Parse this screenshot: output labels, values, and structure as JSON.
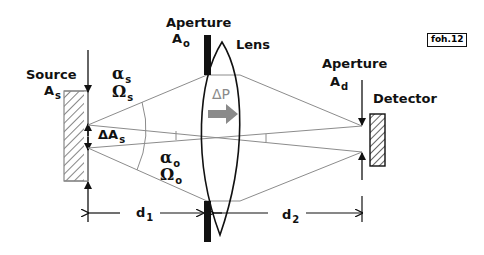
{
  "figure_tag": "foh.12",
  "labels": {
    "source": {
      "name": "Source",
      "symbol": "A",
      "subscript": "s"
    },
    "aperture_o": {
      "name": "Aperture",
      "symbol": "A",
      "subscript": "o"
    },
    "lens": {
      "name": "Lens"
    },
    "aperture_d": {
      "name": "Aperture",
      "symbol": "A",
      "subscript": "d"
    },
    "detector": {
      "name": "Detector"
    },
    "alpha_s": {
      "symbol": "α",
      "subscript": "s"
    },
    "omega_s": {
      "symbol": "Ω",
      "subscript": "s"
    },
    "alpha_o": {
      "symbol": "α",
      "subscript": "o"
    },
    "omega_o": {
      "symbol": "Ω",
      "subscript": "o"
    },
    "delta_As": {
      "symbol": "ΔA",
      "subscript": "s"
    },
    "delta_P": {
      "symbol": "ΔP"
    },
    "d1": {
      "symbol": "d",
      "subscript": "1"
    },
    "d2": {
      "symbol": "d",
      "subscript": "2"
    }
  },
  "colors": {
    "line": "#111111",
    "ray": "#8c8c8c",
    "arrow_fill": "#8a8a8a",
    "background": "#ffffff"
  }
}
